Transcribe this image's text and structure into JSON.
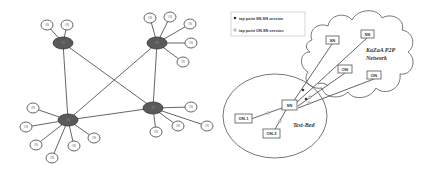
{
  "figure": {
    "left_panel": {
      "description": "KaZaA two-tier overlay: supernodes interconnected, ordinary nodes attached",
      "supernode_label": "SN",
      "ordinary_node_label": "ON",
      "supernodes": [
        {
          "id": "sn-top-left",
          "x": 63,
          "y": 43
        },
        {
          "id": "sn-top-right",
          "x": 157,
          "y": 43
        },
        {
          "id": "sn-bottom-left",
          "x": 68,
          "y": 120
        },
        {
          "id": "sn-bottom-right",
          "x": 153,
          "y": 108
        }
      ],
      "sn_links": [
        [
          "sn-top-left",
          "sn-bottom-left"
        ],
        [
          "sn-top-left",
          "sn-bottom-right"
        ],
        [
          "sn-top-right",
          "sn-bottom-left"
        ],
        [
          "sn-top-right",
          "sn-bottom-right"
        ],
        [
          "sn-bottom-left",
          "sn-bottom-right"
        ]
      ],
      "ordinary_nodes": [
        {
          "parent": "sn-top-left",
          "x": 47,
          "y": 25
        },
        {
          "parent": "sn-top-left",
          "x": 67,
          "y": 25
        },
        {
          "parent": "sn-top-right",
          "x": 150,
          "y": 18
        },
        {
          "parent": "sn-top-right",
          "x": 170,
          "y": 17
        },
        {
          "parent": "sn-top-right",
          "x": 190,
          "y": 24
        },
        {
          "parent": "sn-top-right",
          "x": 191,
          "y": 43
        },
        {
          "parent": "sn-top-right",
          "x": 183,
          "y": 62
        },
        {
          "parent": "sn-bottom-left",
          "x": 33,
          "y": 108
        },
        {
          "parent": "sn-bottom-left",
          "x": 26,
          "y": 127
        },
        {
          "parent": "sn-bottom-left",
          "x": 36,
          "y": 145
        },
        {
          "parent": "sn-bottom-left",
          "x": 52,
          "y": 158
        },
        {
          "parent": "sn-bottom-left",
          "x": 74,
          "y": 146
        },
        {
          "parent": "sn-bottom-left",
          "x": 94,
          "y": 138
        },
        {
          "parent": "sn-bottom-right",
          "x": 191,
          "y": 107
        },
        {
          "parent": "sn-bottom-right",
          "x": 178,
          "y": 126
        },
        {
          "parent": "sn-bottom-right",
          "x": 207,
          "y": 126
        },
        {
          "parent": "sn-bottom-right",
          "x": 156,
          "y": 132
        }
      ]
    },
    "right_panel": {
      "legend": {
        "items": [
          {
            "marker": "filled-dot",
            "label": "tap point SN-SN session"
          },
          {
            "marker": "hollow-dot",
            "label": "tap point ON-SN session"
          }
        ]
      },
      "cloud_label_line1": "KaZaA P2P",
      "cloud_label_line2": "Network",
      "testbed_label": "Test-Bed",
      "testbed_sn": {
        "label": "SN",
        "x": 289,
        "y": 105
      },
      "testbed_ons": [
        {
          "label": "ON-1",
          "x": 243,
          "y": 118
        },
        {
          "label": "ON-2",
          "x": 271,
          "y": 133
        }
      ],
      "cloud_nodes": [
        {
          "label": "SN",
          "x": 332,
          "y": 41,
          "tap": "filled"
        },
        {
          "label": "SN",
          "x": 367,
          "y": 35,
          "tap": "filled"
        },
        {
          "label": "ON",
          "x": 345,
          "y": 70,
          "tap": "hollow"
        },
        {
          "label": "ON",
          "x": 374,
          "y": 76,
          "tap": "hollow"
        }
      ]
    }
  }
}
